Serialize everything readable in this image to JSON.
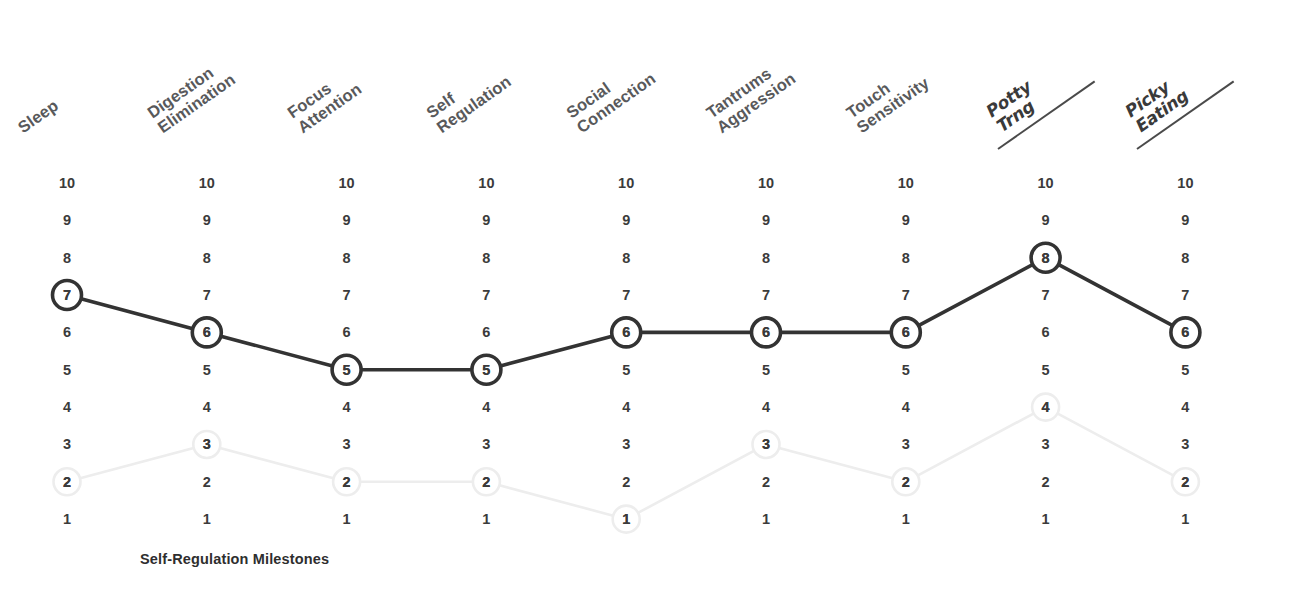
{
  "chart_data": {
    "type": "line",
    "title": "",
    "caption": "Self-Regulation Milestones",
    "xlabel": "",
    "ylabel": "",
    "ylim": [
      1,
      10
    ],
    "grid": false,
    "legend": "none",
    "scale_labels": [
      "10",
      "9",
      "8",
      "7",
      "6",
      "5",
      "4",
      "3",
      "2",
      "1"
    ],
    "categories": [
      "Sleep",
      "Digestion Elimination",
      "Focus Attention",
      "Self Regulation",
      "Social Connection",
      "Tantrums Aggression",
      "Touch Sensitivity",
      "Potty Trng",
      "Picky Eating"
    ],
    "category_lines": [
      [
        "Sleep",
        ""
      ],
      [
        "Digestion",
        "Elimination"
      ],
      [
        "Focus",
        "Attention"
      ],
      [
        "Self",
        "Regulation"
      ],
      [
        "Social",
        "Connection"
      ],
      [
        "Tantrums",
        "Aggression"
      ],
      [
        "Touch",
        "Sensitivity"
      ],
      [
        "Potty",
        "Trng"
      ],
      [
        "Picky",
        "Eating"
      ]
    ],
    "category_styles": [
      "print",
      "print",
      "print",
      "print",
      "print",
      "print",
      "print",
      "handwritten",
      "handwritten"
    ],
    "series": [
      {
        "name": "current",
        "style": "dark",
        "color": "#333333",
        "values": [
          7,
          6,
          5,
          5,
          6,
          6,
          6,
          8,
          6
        ]
      },
      {
        "name": "baseline",
        "style": "faint",
        "color": "#ededed",
        "values": [
          2,
          3,
          2,
          2,
          1,
          3,
          2,
          4,
          2
        ]
      }
    ]
  },
  "colors": {
    "background": "#ffffff",
    "label_text": "#58595b",
    "number_text": "#3b3b3b",
    "dark_series": "#333333",
    "faint_series": "#ededed",
    "caption_text": "#2e2e2e"
  }
}
